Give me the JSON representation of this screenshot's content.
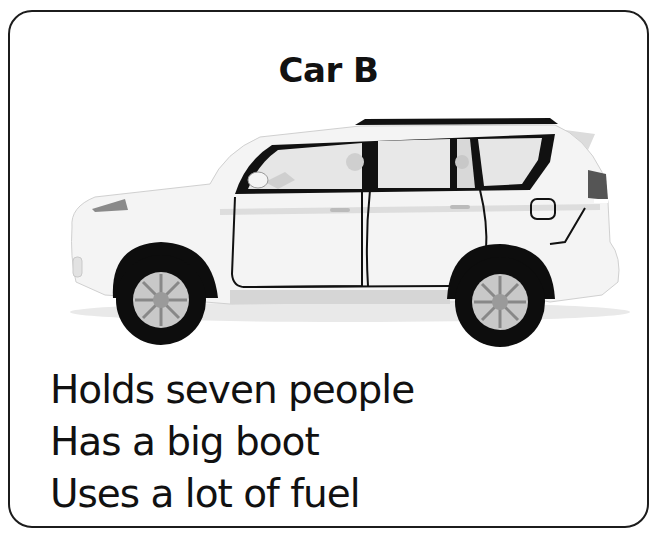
{
  "card": {
    "title": "Car B",
    "image": {
      "icon": "suv-car-illustration",
      "alt": "White SUV side view"
    },
    "features": [
      {
        "label": "Holds seven people"
      },
      {
        "label": "Has a big boot"
      },
      {
        "label": "Uses a lot of fuel"
      }
    ]
  },
  "colors": {
    "border": "#1c1c1c",
    "text": "#111111",
    "car_body": "#f4f4f4",
    "tire": "#0d0d0d",
    "rim": "#c8c8c8",
    "window": "#e6e6e6"
  }
}
